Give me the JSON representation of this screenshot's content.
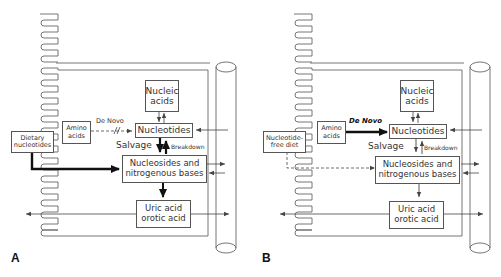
{
  "panels": [
    {
      "letter": "A",
      "diet_box": "Dietary nucleotides",
      "amino_box": "Amino acids",
      "de_novo_label": "De Novo",
      "nucleic_box": "Nucleic acids",
      "nucleotides_box": "Nucleotides",
      "salvage_label": "Salvage",
      "breakdown_label": "Breakdown",
      "nucleosides_box": "Nucleosides and nitrogenous bases",
      "uric_box": "Uric acid orotic acid",
      "de_novo_style": "dashed-blocked",
      "diet_arrow_style": "thick-solid"
    },
    {
      "letter": "B",
      "diet_box": "Nucleotide-free diet",
      "amino_box": "Amino acids",
      "de_novo_label": "De Novo",
      "nucleic_box": "Nucleic acids",
      "nucleotides_box": "Nucleotides",
      "salvage_label": "Salvage",
      "breakdown_label": "Breakdown",
      "nucleosides_box": "Nucleosides and nitrogenous bases",
      "uric_box": "Uric acid orotic acid",
      "de_novo_style": "thick-solid",
      "diet_arrow_style": "dashed"
    }
  ],
  "colors": {
    "line": "#555555",
    "text": "#333333",
    "background": "#ffffff"
  }
}
